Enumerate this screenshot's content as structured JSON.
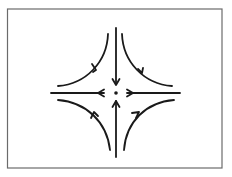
{
  "diagram": {
    "type": "phase-portrait",
    "colors": {
      "stroke": "#1a1a1a",
      "frame": "#6b6b6b",
      "background": "#ffffff"
    },
    "center": {
      "x": 116,
      "y": 93
    },
    "frame": {
      "x": 7,
      "y": 9,
      "width": 215,
      "height": 159
    },
    "axes": {
      "vertical": {
        "from_y": 28,
        "to_y": 157,
        "direction": "inward"
      },
      "horizontal": {
        "from_x": 51,
        "to_x": 180,
        "direction": "outward"
      }
    },
    "trajectories": [
      {
        "quadrant": "top-left",
        "direction": "toward-left"
      },
      {
        "quadrant": "top-right",
        "direction": "toward-right"
      },
      {
        "quadrant": "bottom-left",
        "direction": "toward-left"
      },
      {
        "quadrant": "bottom-right",
        "direction": "toward-right"
      }
    ]
  }
}
